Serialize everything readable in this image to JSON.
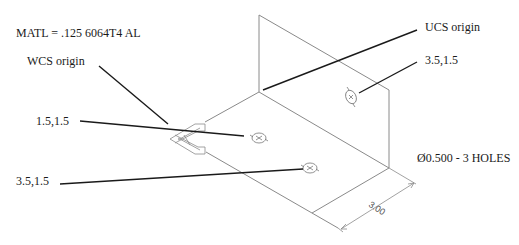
{
  "drawing": {
    "material_note": "MATL = .125 6064T4 AL",
    "hole_note": "Ø0.500 - 3 HOLES",
    "dimension": "3.00",
    "callouts": {
      "wcs_origin": "WCS origin",
      "ucs_origin": "UCS origin",
      "hole_left_top": "1.5,1.5",
      "hole_left_bottom": "3.5,1.5",
      "hole_vertical": "3.5,1.5"
    }
  },
  "colors": {
    "geometry_line": "#8a8a8a",
    "leader_line": "#1a1a1a",
    "text": "#1a1a1a",
    "background": "#ffffff"
  }
}
